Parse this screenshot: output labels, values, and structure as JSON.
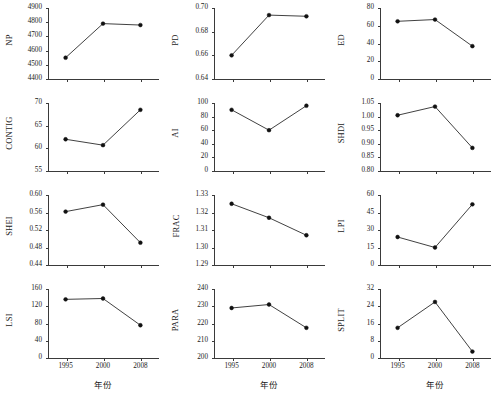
{
  "figure": {
    "x_axis_title": "年份",
    "categories": [
      "1995",
      "2000",
      "2008"
    ]
  },
  "chart_data": [
    {
      "type": "line",
      "title": "",
      "ylabel": "NP",
      "xlabel": "",
      "categories": [
        "1995",
        "2000",
        "2008"
      ],
      "values": [
        4550,
        4790,
        4780
      ],
      "ylim": [
        4400,
        4900
      ],
      "yticks": [
        "4400",
        "4500",
        "4600",
        "4700",
        "4800",
        "4900"
      ],
      "ytick_values": [
        4400,
        4500,
        4600,
        4700,
        4800,
        4900
      ],
      "grid": false,
      "legend": "none"
    },
    {
      "type": "line",
      "title": "",
      "ylabel": "PD",
      "xlabel": "",
      "categories": [
        "1995",
        "2000",
        "2008"
      ],
      "values": [
        0.66,
        0.694,
        0.693
      ],
      "ylim": [
        0.64,
        0.7
      ],
      "yticks": [
        "0.64",
        "0.66",
        "0.68",
        "0.70"
      ],
      "ytick_values": [
        0.64,
        0.66,
        0.68,
        0.7
      ],
      "grid": false,
      "legend": "none"
    },
    {
      "type": "line",
      "title": "",
      "ylabel": "ED",
      "xlabel": "",
      "categories": [
        "1995",
        "2000",
        "2008"
      ],
      "values": [
        65,
        67,
        37
      ],
      "ylim": [
        0,
        80
      ],
      "yticks": [
        "0",
        "20",
        "40",
        "60",
        "80"
      ],
      "ytick_values": [
        0,
        20,
        40,
        60,
        80
      ],
      "grid": false,
      "legend": "none"
    },
    {
      "type": "line",
      "title": "",
      "ylabel": "CONTIG",
      "xlabel": "",
      "categories": [
        "1995",
        "2000",
        "2008"
      ],
      "values": [
        62.0,
        60.7,
        68.5
      ],
      "ylim": [
        55,
        70
      ],
      "yticks": [
        "55",
        "60",
        "65",
        "70"
      ],
      "ytick_values": [
        55,
        60,
        65,
        70
      ],
      "grid": false,
      "legend": "none"
    },
    {
      "type": "line",
      "title": "",
      "ylabel": "AI",
      "xlabel": "",
      "categories": [
        "1995",
        "2000",
        "2008"
      ],
      "values": [
        90,
        60,
        96
      ],
      "ylim": [
        0,
        100
      ],
      "yticks": [
        "0",
        "20",
        "40",
        "60",
        "80",
        "100"
      ],
      "ytick_values": [
        0,
        20,
        40,
        60,
        80,
        100
      ],
      "grid": false,
      "legend": "none"
    },
    {
      "type": "line",
      "title": "",
      "ylabel": "SHDI",
      "xlabel": "",
      "categories": [
        "1995",
        "2000",
        "2008"
      ],
      "values": [
        1.005,
        1.037,
        0.885
      ],
      "ylim": [
        0.8,
        1.05
      ],
      "yticks": [
        "0.80",
        "0.85",
        "0.90",
        "0.95",
        "1.00",
        "1.05"
      ],
      "ytick_values": [
        0.8,
        0.85,
        0.9,
        0.95,
        1.0,
        1.05
      ],
      "grid": false,
      "legend": "none"
    },
    {
      "type": "line",
      "title": "",
      "ylabel": "SHEI",
      "xlabel": "",
      "categories": [
        "1995",
        "2000",
        "2008"
      ],
      "values": [
        0.562,
        0.578,
        0.491
      ],
      "ylim": [
        0.44,
        0.6
      ],
      "yticks": [
        "0.44",
        "0.48",
        "0.52",
        "0.56",
        "0.60"
      ],
      "ytick_values": [
        0.44,
        0.48,
        0.52,
        0.56,
        0.6
      ],
      "grid": false,
      "legend": "none"
    },
    {
      "type": "line",
      "title": "",
      "ylabel": "FRAC",
      "xlabel": "",
      "categories": [
        "1995",
        "2000",
        "2008"
      ],
      "values": [
        1.325,
        1.317,
        1.307
      ],
      "ylim": [
        1.29,
        1.33
      ],
      "yticks": [
        "1.29",
        "1.30",
        "1.31",
        "1.32",
        "1.33"
      ],
      "ytick_values": [
        1.29,
        1.3,
        1.31,
        1.32,
        1.33
      ],
      "grid": false,
      "legend": "none"
    },
    {
      "type": "line",
      "title": "",
      "ylabel": "LPI",
      "xlabel": "",
      "categories": [
        "1995",
        "2000",
        "2008"
      ],
      "values": [
        24,
        15,
        52
      ],
      "ylim": [
        0,
        60
      ],
      "yticks": [
        "0",
        "15",
        "30",
        "45",
        "60"
      ],
      "ytick_values": [
        0,
        15,
        30,
        45,
        60
      ],
      "grid": false,
      "legend": "none"
    },
    {
      "type": "line",
      "title": "",
      "ylabel": "LSI",
      "xlabel": "年份",
      "categories": [
        "1995",
        "2000",
        "2008"
      ],
      "values": [
        136,
        138,
        76
      ],
      "ylim": [
        0,
        160
      ],
      "yticks": [
        "0",
        "40",
        "80",
        "120",
        "160"
      ],
      "ytick_values": [
        0,
        40,
        80,
        120,
        160
      ],
      "grid": false,
      "legend": "none"
    },
    {
      "type": "line",
      "title": "",
      "ylabel": "PARA",
      "xlabel": "年份",
      "categories": [
        "1995",
        "2000",
        "2008"
      ],
      "values": [
        229,
        231,
        217.5
      ],
      "ylim": [
        200,
        240
      ],
      "yticks": [
        "200",
        "210",
        "220",
        "230",
        "240"
      ],
      "ytick_values": [
        200,
        210,
        220,
        230,
        240
      ],
      "grid": false,
      "legend": "none"
    },
    {
      "type": "line",
      "title": "",
      "ylabel": "SPLIT",
      "xlabel": "年份",
      "categories": [
        "1995",
        "2000",
        "2008"
      ],
      "values": [
        14,
        26,
        3
      ],
      "ylim": [
        0,
        32
      ],
      "yticks": [
        "0",
        "8",
        "16",
        "24",
        "32"
      ],
      "ytick_values": [
        0,
        8,
        16,
        24,
        32
      ],
      "grid": false,
      "legend": "none"
    }
  ],
  "colors": {
    "axis": "#3a3a3a",
    "line": "#2b2b2b",
    "marker": "#111111",
    "background": "#ffffff"
  }
}
